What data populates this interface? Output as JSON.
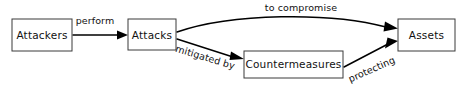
{
  "diagram": {
    "type": "flow-diagram",
    "title": "",
    "background_color": "#ffffff",
    "stroke_color": "#000000",
    "box_stroke_color": "#3a3a3a",
    "text_color": "#111111",
    "nodes": [
      {
        "id": "attackers",
        "label": "Attackers",
        "x": 12,
        "y": 19,
        "w": 60,
        "h": 32
      },
      {
        "id": "attacks",
        "label": "Attacks",
        "x": 128,
        "y": 19,
        "w": 48,
        "h": 31
      },
      {
        "id": "countermeasures",
        "label": "Countermeasures",
        "x": 244,
        "y": 51,
        "w": 99,
        "h": 27
      },
      {
        "id": "assets",
        "label": "Assets",
        "x": 398,
        "y": 19,
        "w": 57,
        "h": 32
      }
    ],
    "edges": [
      {
        "id": "perform",
        "from": "attackers",
        "to": "attacks",
        "label": "perform",
        "shape": "straight",
        "label_rotation": 0
      },
      {
        "id": "to-compromise",
        "from": "attacks",
        "to": "assets",
        "label": "to compromise",
        "shape": "curved",
        "label_rotation": 0
      },
      {
        "id": "mitigated-by",
        "from": "attacks",
        "to": "countermeasures",
        "label": "mitigated by",
        "shape": "straight",
        "label_rotation": 17
      },
      {
        "id": "protecting",
        "from": "countermeasures",
        "to": "assets",
        "label": "protecting",
        "shape": "straight",
        "label_rotation": -24
      }
    ]
  }
}
